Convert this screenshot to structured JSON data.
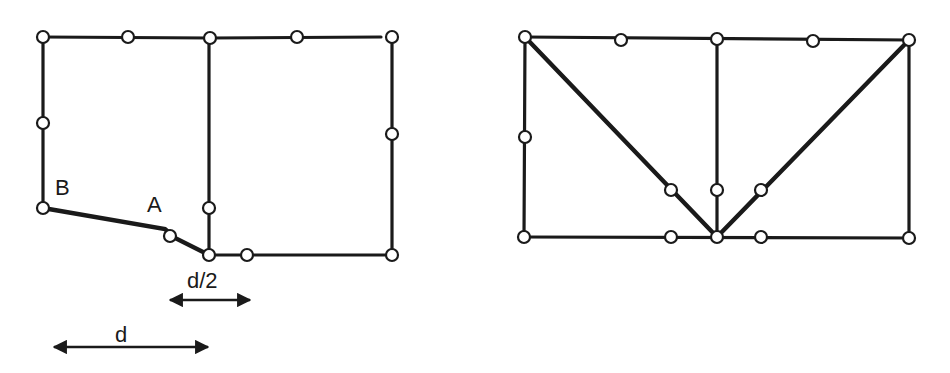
{
  "colors": {
    "line": "#1a1a1a",
    "node_fill": "#ffffff",
    "background": "#ffffff"
  },
  "left_frame": {
    "labels": {
      "point_b": "B",
      "point_a": "A"
    },
    "dimensions": {
      "half_span_label": "d/2",
      "span_label": "d"
    }
  },
  "right_frame": {}
}
